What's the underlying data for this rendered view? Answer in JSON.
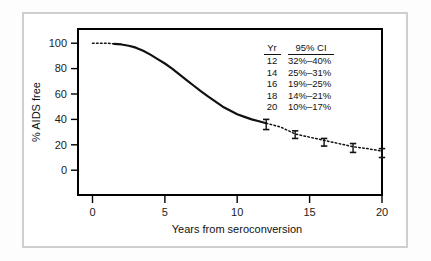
{
  "chart_data": {
    "type": "line",
    "title": "",
    "xlabel": "Years from seroconversion",
    "ylabel": "% AIDS free",
    "xlim": [
      0,
      21
    ],
    "ylim": [
      0,
      105
    ],
    "xticks": [
      "0",
      "5",
      "10",
      "15",
      "20"
    ],
    "xtick_values": [
      0,
      5,
      10,
      15,
      20
    ],
    "yticks": [
      "0",
      "20",
      "40",
      "60",
      "80",
      "100"
    ],
    "ytick_values": [
      0,
      20,
      40,
      60,
      80,
      100
    ],
    "grid": false,
    "legend_position": "upper-right-inset",
    "series": [
      {
        "name": "AIDS-free survival (observed)",
        "style": "solid",
        "x": [
          1.5,
          2.0,
          2.5,
          3.0,
          3.5,
          4.0,
          4.5,
          5.0,
          5.5,
          6.0,
          6.5,
          7.0,
          7.5,
          8.0,
          8.5,
          9.0,
          9.5,
          10.0,
          10.5,
          11.0,
          11.5,
          12.0
        ],
        "values": [
          99.5,
          99.0,
          98.0,
          96.5,
          94.0,
          91.0,
          87.5,
          84.0,
          80.0,
          75.5,
          71.0,
          66.5,
          62.0,
          58.0,
          54.0,
          50.0,
          47.0,
          44.0,
          42.0,
          40.0,
          38.5,
          37.0
        ]
      },
      {
        "name": "AIDS-free survival (extrapolated)",
        "style": "dotted",
        "x": [
          0.0,
          0.5,
          1.0,
          1.5,
          12.0,
          13.0,
          14.0,
          15.0,
          16.0,
          17.0,
          18.0,
          19.0,
          20.0
        ],
        "values": [
          100.0,
          100.0,
          100.0,
          99.5,
          37.0,
          34.0,
          28.5,
          26.0,
          23.5,
          21.0,
          18.5,
          17.0,
          15.0
        ]
      }
    ],
    "error_bars": [
      {
        "year": 12,
        "estimate": 37.0,
        "low": 32,
        "high": 40
      },
      {
        "year": 14,
        "estimate": 28.5,
        "low": 25,
        "high": 31
      },
      {
        "year": 16,
        "estimate": 23.5,
        "low": 19,
        "high": 25
      },
      {
        "year": 18,
        "estimate": 18.5,
        "low": 14,
        "high": 21
      },
      {
        "year": 20,
        "estimate": 15.0,
        "low": 10,
        "high": 17
      }
    ],
    "legend_table": {
      "headers": [
        "Yr",
        "95% CI"
      ],
      "rows": [
        {
          "yr": "12",
          "ci": "32%–40%"
        },
        {
          "yr": "14",
          "ci": "25%–31%"
        },
        {
          "yr": "16",
          "ci": "19%–25%"
        },
        {
          "yr": "18",
          "ci": "14%–21%"
        },
        {
          "yr": "20",
          "ci": "10%–17%"
        }
      ]
    },
    "colors": {
      "curve": "#111111",
      "frame": "#000000",
      "outer_border": "#cfcfcf",
      "background": "#ffffff",
      "text": "#111111"
    }
  }
}
